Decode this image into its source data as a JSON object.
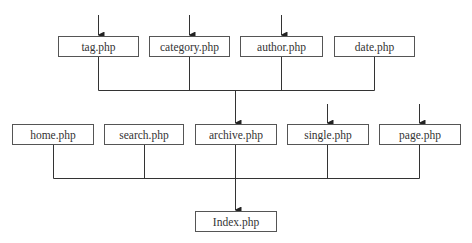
{
  "diagram": {
    "colors": {
      "line": "#333333",
      "border": "#555555",
      "text": "#333333",
      "background": "#ffffff"
    },
    "top_row": [
      {
        "label": "tag.php",
        "has_input_arrow": true
      },
      {
        "label": "category.php",
        "has_input_arrow": true
      },
      {
        "label": "author.php",
        "has_input_arrow": true
      },
      {
        "label": "date.php",
        "has_input_arrow": false
      }
    ],
    "middle_row": [
      {
        "label": "home.php",
        "has_input_arrow": false
      },
      {
        "label": "search.php",
        "has_input_arrow": false
      },
      {
        "label": "archive.php",
        "has_input_arrow": true
      },
      {
        "label": "single.php",
        "has_input_arrow": true
      },
      {
        "label": "page.php",
        "has_input_arrow": true
      }
    ],
    "bottom": {
      "label": "Index.php"
    },
    "edges": [
      {
        "from": [
          "tag.php",
          "category.php",
          "author.php",
          "date.php"
        ],
        "to": "archive.php"
      },
      {
        "from": [
          "home.php",
          "search.php",
          "archive.php",
          "single.php",
          "page.php"
        ],
        "to": "Index.php"
      }
    ]
  }
}
